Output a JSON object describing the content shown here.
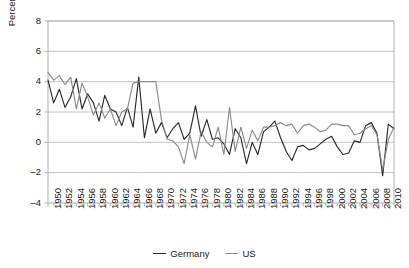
{
  "chart_data": {
    "type": "line",
    "title": "",
    "subtitle": "",
    "xlabel": "",
    "ylabel": "Percentage",
    "ylim": [
      -4,
      8
    ],
    "yticks": [
      -4,
      -2,
      0,
      2,
      4,
      6,
      8
    ],
    "ytick_labels": [
      "–4",
      "–2",
      "0",
      "2",
      "4",
      "6",
      "8"
    ],
    "xlim": [
      1950,
      2011
    ],
    "grid": "horizontal",
    "legend_position": "bottom-center",
    "x": [
      1950,
      1951,
      1952,
      1953,
      1954,
      1955,
      1956,
      1957,
      1958,
      1959,
      1960,
      1961,
      1962,
      1963,
      1964,
      1965,
      1966,
      1967,
      1968,
      1969,
      1970,
      1971,
      1972,
      1973,
      1974,
      1975,
      1976,
      1977,
      1978,
      1979,
      1980,
      1981,
      1982,
      1983,
      1984,
      1985,
      1986,
      1987,
      1988,
      1989,
      1990,
      1991,
      1992,
      1993,
      1994,
      1995,
      1996,
      1997,
      1998,
      1999,
      2000,
      2001,
      2002,
      2003,
      2004,
      2005,
      2006,
      2007,
      2008,
      2009,
      2010,
      2011
    ],
    "xtick_labels": [
      "1950",
      "1952",
      "1954",
      "1956",
      "1958",
      "1960",
      "1962",
      "1964",
      "1966",
      "1968",
      "1970",
      "1972",
      "1974",
      "1976",
      "1978",
      "1980",
      "1982",
      "1984",
      "1986",
      "1988",
      "1990",
      "1992",
      "1994",
      "1996",
      "1998",
      "2000",
      "2002",
      "2004",
      "2006",
      "2008",
      "2010"
    ],
    "xtick_label_step_years": 2,
    "xtick_minor_step_years": 1,
    "series": [
      {
        "name": "Germany",
        "color": "#2b2b2b",
        "values": [
          4.1,
          2.6,
          3.5,
          2.3,
          3.0,
          4.2,
          2.2,
          3.2,
          2.6,
          1.4,
          3.1,
          2.2,
          2.0,
          1.1,
          2.3,
          1.0,
          4.3,
          0.3,
          2.2,
          0.6,
          1.3,
          0.3,
          0.9,
          1.3,
          0.2,
          0.6,
          2.4,
          0.4,
          1.5,
          0.2,
          0.3,
          -0.1,
          -0.8,
          0.9,
          0.3,
          -1.4,
          0.0,
          -0.8,
          0.7,
          1.0,
          1.4,
          0.3,
          -0.6,
          -1.2,
          -0.3,
          -0.2,
          -0.5,
          -0.4,
          -0.1,
          0.2,
          0.4,
          -0.3,
          -0.8,
          -0.7,
          0.1,
          0.0,
          1.1,
          1.3,
          0.6,
          -2.2,
          1.2,
          0.9
        ]
      },
      {
        "name": "US",
        "color": "#8c8c8c",
        "values": [
          4.6,
          4.1,
          4.4,
          3.8,
          4.3,
          2.2,
          3.9,
          3.0,
          1.8,
          2.6,
          1.6,
          2.2,
          1.1,
          2.0,
          2.2,
          3.9,
          4.0,
          4.0,
          4.0,
          4.0,
          1.5,
          0.2,
          0.1,
          -0.3,
          -1.4,
          0.5,
          -1.1,
          0.7,
          0.0,
          -0.3,
          1.0,
          -0.8,
          2.3,
          -0.6,
          1.0,
          -0.4,
          0.8,
          0.1,
          1.0,
          1.0,
          1.1,
          1.3,
          1.1,
          1.2,
          0.6,
          1.1,
          1.2,
          1.0,
          0.7,
          0.8,
          1.2,
          1.2,
          1.1,
          1.1,
          0.5,
          0.6,
          0.9,
          1.1,
          0.5,
          -1.8,
          0.2,
          1.0
        ]
      }
    ],
    "legend": [
      {
        "label": "Germany",
        "color": "#2b2b2b"
      },
      {
        "label": "US",
        "color": "#8c8c8c"
      }
    ],
    "axis_color": "#b0b0b0",
    "grid_color": "#b5b5b5",
    "plot_box": {
      "left": 48,
      "top": 21,
      "right": 394,
      "bottom": 203
    }
  }
}
